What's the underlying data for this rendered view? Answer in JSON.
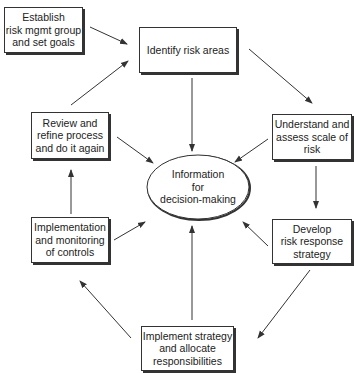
{
  "diagram": {
    "type": "cycle-flowchart",
    "center": {
      "label": "Information\nfor\ndecision-making"
    },
    "nodes": [
      {
        "id": "establish",
        "label": "Establish\nrisk mgmt group\nand set goals"
      },
      {
        "id": "identify",
        "label": "Identify risk areas"
      },
      {
        "id": "understand",
        "label": "Understand and\nassess scale of\nrisk"
      },
      {
        "id": "develop",
        "label": "Develop\nrisk response\nstrategy"
      },
      {
        "id": "implement_strategy",
        "label": "Implement strategy\nand allocate\nresponsibilities"
      },
      {
        "id": "implementation",
        "label": "Implementation\nand monitoring\nof controls"
      },
      {
        "id": "review",
        "label": "Review and\nrefine process\nand do it again"
      }
    ],
    "edges": [
      {
        "from": "establish",
        "to": "identify"
      },
      {
        "from": "identify",
        "to": "understand"
      },
      {
        "from": "understand",
        "to": "develop"
      },
      {
        "from": "develop",
        "to": "implement_strategy"
      },
      {
        "from": "implement_strategy",
        "to": "implementation"
      },
      {
        "from": "implementation",
        "to": "review"
      },
      {
        "from": "review",
        "to": "identify"
      },
      {
        "from": "identify",
        "to": "center"
      },
      {
        "from": "understand",
        "to": "center"
      },
      {
        "from": "develop",
        "to": "center"
      },
      {
        "from": "implement_strategy",
        "to": "center"
      },
      {
        "from": "implementation",
        "to": "center"
      },
      {
        "from": "review",
        "to": "center"
      }
    ],
    "colors": {
      "line": "#333333",
      "fill": "#ffffff",
      "text": "#222222"
    }
  }
}
